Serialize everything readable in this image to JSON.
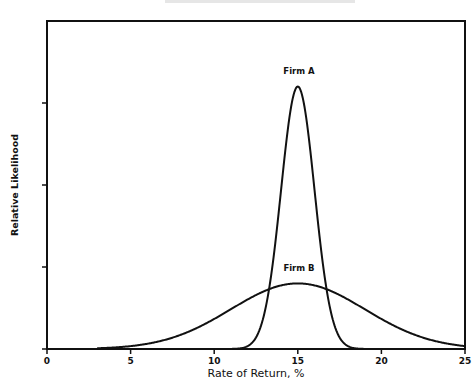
{
  "chart_data": {
    "type": "line",
    "title": "",
    "xlabel": "Rate of Return, %",
    "ylabel": "Relative Likelihood",
    "xlim": [
      0,
      25
    ],
    "ylim": [
      0,
      1
    ],
    "x_ticks": [
      0,
      5,
      10,
      15,
      20,
      25
    ],
    "x_tick_labels": [
      "0",
      "5",
      "10",
      "15",
      "20",
      "25"
    ],
    "y_ticks_unlabeled": [
      0.25,
      0.5,
      0.75
    ],
    "grid": false,
    "legend": "inline labels above curves",
    "series": [
      {
        "name": "Firm A",
        "distribution": "normal",
        "mean": 15,
        "std": 1.0,
        "peak": 0.8,
        "x": [
          11,
          12,
          13,
          13.5,
          14,
          14.5,
          15,
          15.5,
          16,
          16.5,
          17,
          18,
          19
        ],
        "values": [
          0.0003,
          0.009,
          0.108,
          0.26,
          0.485,
          0.706,
          0.8,
          0.706,
          0.485,
          0.26,
          0.108,
          0.009,
          0.0003
        ]
      },
      {
        "name": "Firm B",
        "distribution": "normal",
        "mean": 15,
        "std": 4.0,
        "peak": 0.2,
        "x": [
          3,
          5,
          7,
          9,
          11,
          13,
          15,
          17,
          19,
          21,
          23,
          25
        ],
        "values": [
          0.022,
          0.044,
          0.074,
          0.106,
          0.121,
          0.176,
          0.2,
          0.176,
          0.121,
          0.065,
          0.027,
          0.009
        ]
      }
    ],
    "annotations": [
      {
        "text": "Firm A",
        "x": 15,
        "y": 0.85
      },
      {
        "text": "Firm B",
        "x": 15,
        "y": 0.25
      }
    ]
  },
  "labels": {
    "xlabel": "Rate of Return, %",
    "ylabel": "Relative Likelihood",
    "firm_a": "Firm A",
    "firm_b": "Firm B",
    "ticks": [
      "0",
      "5",
      "10",
      "15",
      "20",
      "25"
    ]
  }
}
